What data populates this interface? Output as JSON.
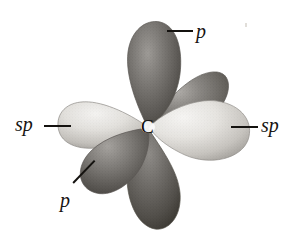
{
  "figure": {
    "type": "orbital-hybridization-diagram",
    "background_color": "#ffffff",
    "center_atom": {
      "label": "C",
      "x": 148,
      "y": 127
    },
    "labels": [
      {
        "id": "p-top",
        "text": "p",
        "x": 196,
        "y": 22,
        "style": "italic"
      },
      {
        "id": "sp-left",
        "text": "sp",
        "x": 16,
        "y": 114,
        "style": "italic"
      },
      {
        "id": "sp-right",
        "text": "sp",
        "x": 261,
        "y": 115,
        "style": "italic"
      },
      {
        "id": "p-bottomleft",
        "text": "p",
        "x": 60,
        "y": 190,
        "style": "italic"
      }
    ],
    "leader_lines": [
      {
        "id": "leader-p-top",
        "x1": 167,
        "y1": 31,
        "x2": 192,
        "y2": 31
      },
      {
        "id": "leader-sp-left",
        "x1": 44,
        "y1": 126,
        "x2": 70,
        "y2": 126
      },
      {
        "id": "leader-sp-right",
        "x1": 231,
        "y1": 127,
        "x2": 257,
        "y2": 127
      },
      {
        "id": "leader-p-bottomleft",
        "x1": 74,
        "y1": 194,
        "x2": 96,
        "y2": 171
      }
    ],
    "lobes": [
      {
        "id": "p-lobe-top",
        "kind": "p",
        "shade": "dark",
        "direction": "up"
      },
      {
        "id": "p-lobe-upper-right",
        "kind": "p",
        "shade": "dark",
        "direction": "upper-right"
      },
      {
        "id": "sp-lobe-right",
        "kind": "sp",
        "shade": "light",
        "direction": "right"
      },
      {
        "id": "p-lobe-bottom",
        "kind": "p",
        "shade": "dark",
        "direction": "down"
      },
      {
        "id": "p-lobe-lower-left",
        "kind": "p",
        "shade": "dark",
        "direction": "lower-left"
      },
      {
        "id": "sp-lobe-left",
        "kind": "sp",
        "shade": "light",
        "direction": "left"
      }
    ],
    "colors": {
      "dark_lobe": "#6d6a66",
      "dark_lobe_shadow": "#45423f",
      "light_lobe": "#e3e1dd",
      "light_lobe_shadow": "#a9a5a0",
      "outline": "#6b6864",
      "label_color": "#161311"
    },
    "artifact": {
      "id": "scan-speck",
      "x": 245,
      "y": 24
    }
  }
}
